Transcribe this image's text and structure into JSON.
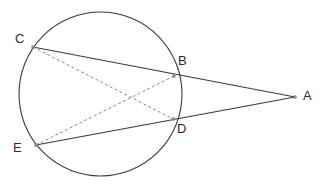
{
  "figure": {
    "type": "geometry-diagram",
    "background_color": "#ffffff",
    "stroke_color": "#3a3a3a",
    "dashed_stroke_color": "#8a8a8a",
    "marker_color": "#8a8a8a",
    "label_color": "#2b2b2b",
    "canvas": {
      "width": 330,
      "height": 190
    },
    "circle": {
      "name": "circle",
      "center_x": 100.5,
      "center_y": 94,
      "radius_x": 81.5,
      "radius_y": 82,
      "style": "solid"
    },
    "points": [
      {
        "id": "A",
        "label": "A",
        "x": 295,
        "y": 97,
        "label_x": 303,
        "label_y": 89
      },
      {
        "id": "B",
        "label": "B",
        "x": 174,
        "y": 76,
        "label_x": 178,
        "label_y": 54
      },
      {
        "id": "C",
        "label": "C",
        "x": 33,
        "y": 47,
        "label_x": 15,
        "label_y": 32
      },
      {
        "id": "D",
        "label": "D",
        "x": 173,
        "y": 119,
        "label_x": 177,
        "label_y": 122
      },
      {
        "id": "E",
        "label": "E",
        "x": 36,
        "y": 145,
        "label_x": 13,
        "label_y": 141
      }
    ],
    "segments": [
      {
        "id": "CA",
        "from": "C",
        "to": "A",
        "style": "solid",
        "name": "secant-line-c-b-a"
      },
      {
        "id": "EA",
        "from": "E",
        "to": "A",
        "style": "solid",
        "name": "secant-line-e-d-a"
      },
      {
        "id": "CD",
        "from": "C",
        "to": "D",
        "style": "dashed",
        "name": "chord-c-d"
      },
      {
        "id": "EB",
        "from": "E",
        "to": "B",
        "style": "dashed",
        "name": "chord-e-b"
      }
    ]
  }
}
